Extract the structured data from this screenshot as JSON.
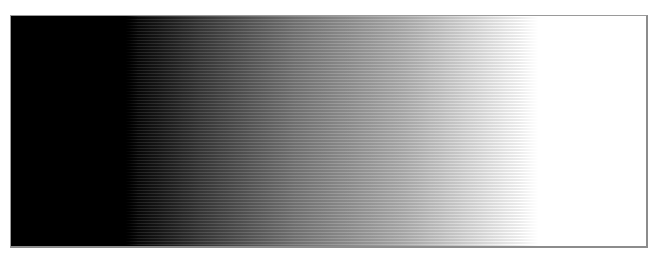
{
  "gradient_panel": {
    "orientation": "horizontal",
    "start_color": "#000000",
    "end_color": "#ffffff",
    "stops": [
      {
        "color": "#000000",
        "position": "0%"
      },
      {
        "color": "#000000",
        "position": "18.5%"
      },
      {
        "color": "#3a3a3a",
        "position": "30%"
      },
      {
        "color": "#7a7a7a",
        "position": "45%"
      },
      {
        "color": "#b4b4b4",
        "position": "62%"
      },
      {
        "color": "#e6e6e6",
        "position": "74%"
      },
      {
        "color": "#ffffff",
        "position": "80%"
      },
      {
        "color": "#ffffff",
        "position": "100%"
      }
    ],
    "border_color": "#9a9a9a",
    "texture": "horizontal-halftone-scanlines"
  }
}
